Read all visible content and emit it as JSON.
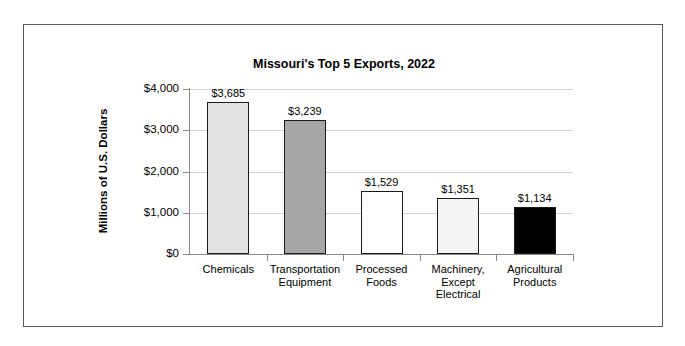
{
  "scan_artifact": {
    "text": "",
    "visible": true
  },
  "chart_data": {
    "type": "bar",
    "title": "Missouri's Top 5 Exports, 2022",
    "xlabel": "",
    "ylabel": "Millions of U.S. Dollars",
    "ylim": [
      0,
      4000
    ],
    "grid": true,
    "legend": "none",
    "categories": [
      "Chemicals",
      "Transportation Equipment",
      "Processed Foods",
      "Machinery, Except Electrical",
      "Agricultural Products"
    ],
    "category_lines": [
      [
        "Chemicals"
      ],
      [
        "Transportation",
        "Equipment"
      ],
      [
        "Processed",
        "Foods"
      ],
      [
        "Machinery,",
        "Except",
        "Electrical"
      ],
      [
        "Agricultural",
        "Products"
      ]
    ],
    "values": [
      3685,
      3239,
      1529,
      1351,
      1134
    ],
    "value_labels": [
      "$3,685",
      "$3,239",
      "$1,529",
      "$1,351",
      "$1,134"
    ],
    "bar_colors": [
      "#e2e2e2",
      "#a6a6a6",
      "#ffffff",
      "#f4f4f4",
      "#000000"
    ],
    "bar_border_color": "#1a1a1a",
    "yticks": [
      0,
      1000,
      2000,
      3000,
      4000
    ],
    "ytick_labels": [
      "$0",
      "$1,000",
      "$2,000",
      "$3,000",
      "$4,000"
    ],
    "gridline_color": "#d4d4d4",
    "axis_color": "#8a8a8a",
    "frame_border_color": "#5a5a5a"
  }
}
